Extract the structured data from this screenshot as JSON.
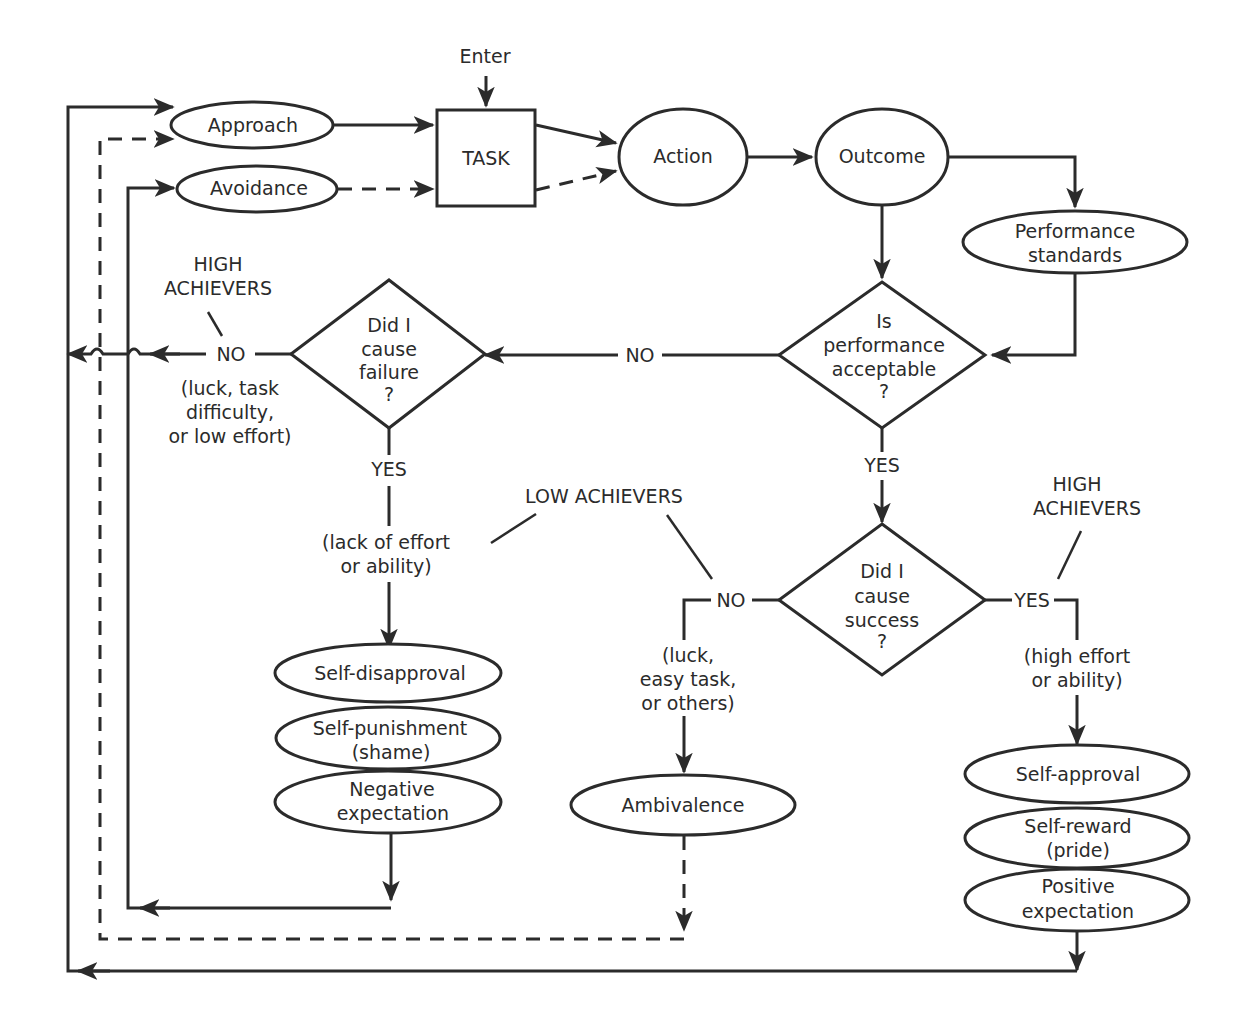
{
  "diagram": {
    "enter": "Enter",
    "nodes": {
      "approach": "Approach",
      "avoidance": "Avoidance",
      "task": "TASK",
      "action": "Action",
      "outcome": "Outcome",
      "performance_standards": [
        "Performance",
        "standards"
      ],
      "is_performance_acceptable": [
        "Is",
        "performance",
        "acceptable",
        "?"
      ],
      "did_i_cause_failure": [
        "Did I",
        "cause",
        "failure",
        "?"
      ],
      "did_i_cause_success": [
        "Did I",
        "cause",
        "success",
        "?"
      ],
      "self_disapproval": "Self-disapproval",
      "self_punishment": [
        "Self-punishment",
        "(shame)"
      ],
      "negative_expectation": [
        "Negative",
        "expectation"
      ],
      "ambivalence": "Ambivalence",
      "self_approval": "Self-approval",
      "self_reward": [
        "Self-reward",
        "(pride)"
      ],
      "positive_expectation": [
        "Positive",
        "expectation"
      ]
    },
    "edge_labels": {
      "no_acceptable": "NO",
      "yes_acceptable": "YES",
      "no_failure": "NO",
      "yes_failure": "YES",
      "no_success": "NO",
      "yes_success": "YES",
      "failure_no_reasons": [
        "(luck, task",
        "difficulty,",
        "or low effort)"
      ],
      "failure_yes_reasons": [
        "(lack of effort",
        "or ability)"
      ],
      "success_no_reasons": [
        "(luck,",
        "easy task,",
        "or others)"
      ],
      "success_yes_reasons": [
        "(high effort",
        "or ability)"
      ]
    },
    "annotations": {
      "high_achievers_left": [
        "HIGH",
        "ACHIEVERS"
      ],
      "high_achievers_right": [
        "HIGH",
        "ACHIEVERS"
      ],
      "low_achievers": "LOW ACHIEVERS"
    },
    "colors": {
      "ink": "#2b2b2b",
      "background": "#ffffff"
    }
  }
}
